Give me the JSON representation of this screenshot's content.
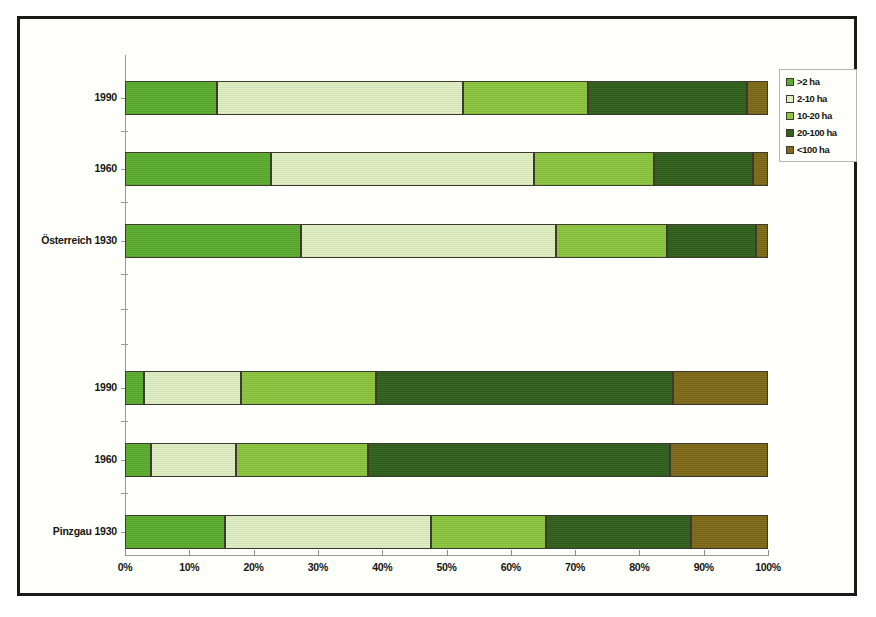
{
  "chart_data": {
    "type": "bar",
    "orientation": "horizontal",
    "stacked": true,
    "stack_unit": "percent",
    "title": "",
    "xlabel": "",
    "ylabel": "",
    "xlim": [
      0,
      100
    ],
    "grid": false,
    "legend_position": "top-right",
    "xticks": [
      "0%",
      "10%",
      "20%",
      "30%",
      "40%",
      "50%",
      "60%",
      "70%",
      "80%",
      "90%",
      "100%"
    ],
    "xtick_values": [
      0,
      10,
      20,
      30,
      40,
      50,
      60,
      70,
      80,
      90,
      100
    ],
    "categories": [
      "1990",
      "1960",
      "Österreich 1930",
      "1990",
      "1960",
      "Pinzgau 1930"
    ],
    "legend": [
      {
        "label": ">2 ha",
        "color": "#5cad2f"
      },
      {
        "label": "2-10 ha",
        "color": "#dff0c2"
      },
      {
        "label": "10-20 ha",
        "color": "#8cc63f"
      },
      {
        "label": "20-100 ha",
        "color": "#31601c"
      },
      {
        "label": "<100 ha",
        "color": "#7e6a18"
      }
    ],
    "series": [
      {
        "name": ">2 ha",
        "color": "#5cad2f",
        "values": [
          14.3,
          22.7,
          27.4,
          3.0,
          4.0,
          15.5
        ]
      },
      {
        "name": "2-10 ha",
        "color": "#dff0c2",
        "values": [
          38.2,
          40.9,
          39.6,
          15.0,
          13.3,
          32.1
        ]
      },
      {
        "name": "10-20 ha",
        "color": "#8cc63f",
        "values": [
          19.5,
          18.7,
          17.3,
          21.0,
          20.5,
          17.9
        ]
      },
      {
        "name": "20-100 ha",
        "color": "#31601c",
        "values": [
          24.8,
          15.4,
          13.8,
          46.3,
          47.0,
          22.5
        ]
      },
      {
        "name": "<100 ha",
        "color": "#7e6a18",
        "values": [
          3.2,
          2.3,
          1.9,
          14.7,
          15.2,
          12.0
        ]
      }
    ],
    "rows": [
      {
        "label": "1990",
        "group": "Österreich",
        "segments": [
          {
            "name": ">2 ha",
            "start": 0.0,
            "end": 14.3,
            "value": 14.3,
            "color": "#5cad2f"
          },
          {
            "name": "2-10 ha",
            "start": 14.3,
            "end": 52.5,
            "value": 38.2,
            "color": "#dff0c2"
          },
          {
            "name": "10-20 ha",
            "start": 52.5,
            "end": 72.0,
            "value": 19.5,
            "color": "#8cc63f"
          },
          {
            "name": "20-100 ha",
            "start": 72.0,
            "end": 96.8,
            "value": 24.8,
            "color": "#31601c"
          },
          {
            "name": "<100 ha",
            "start": 96.8,
            "end": 100.0,
            "value": 3.2,
            "color": "#7e6a18"
          }
        ]
      },
      {
        "label": "1960",
        "group": "Österreich",
        "segments": [
          {
            "name": ">2 ha",
            "start": 0.0,
            "end": 22.7,
            "value": 22.7,
            "color": "#5cad2f"
          },
          {
            "name": "2-10 ha",
            "start": 22.7,
            "end": 63.6,
            "value": 40.9,
            "color": "#dff0c2"
          },
          {
            "name": "10-20 ha",
            "start": 63.6,
            "end": 82.3,
            "value": 18.7,
            "color": "#8cc63f"
          },
          {
            "name": "20-100 ha",
            "start": 82.3,
            "end": 97.7,
            "value": 15.4,
            "color": "#31601c"
          },
          {
            "name": "<100 ha",
            "start": 97.7,
            "end": 100.0,
            "value": 2.3,
            "color": "#7e6a18"
          }
        ]
      },
      {
        "label": "Österreich 1930",
        "group": "Österreich",
        "segments": [
          {
            "name": ">2 ha",
            "start": 0.0,
            "end": 27.4,
            "value": 27.4,
            "color": "#5cad2f"
          },
          {
            "name": "2-10 ha",
            "start": 27.4,
            "end": 67.0,
            "value": 39.6,
            "color": "#dff0c2"
          },
          {
            "name": "10-20 ha",
            "start": 67.0,
            "end": 84.3,
            "value": 17.3,
            "color": "#8cc63f"
          },
          {
            "name": "20-100 ha",
            "start": 84.3,
            "end": 98.1,
            "value": 13.8,
            "color": "#31601c"
          },
          {
            "name": "<100 ha",
            "start": 98.1,
            "end": 100.0,
            "value": 1.9,
            "color": "#7e6a18"
          }
        ]
      },
      {
        "label": "1990",
        "group": "Pinzgau",
        "segments": [
          {
            "name": ">2 ha",
            "start": 0.0,
            "end": 3.0,
            "value": 3.0,
            "color": "#5cad2f"
          },
          {
            "name": "2-10 ha",
            "start": 3.0,
            "end": 18.0,
            "value": 15.0,
            "color": "#dff0c2"
          },
          {
            "name": "10-20 ha",
            "start": 18.0,
            "end": 39.0,
            "value": 21.0,
            "color": "#8cc63f"
          },
          {
            "name": "20-100 ha",
            "start": 39.0,
            "end": 85.3,
            "value": 46.3,
            "color": "#31601c"
          },
          {
            "name": "<100 ha",
            "start": 85.3,
            "end": 100.0,
            "value": 14.7,
            "color": "#7e6a18"
          }
        ]
      },
      {
        "label": "1960",
        "group": "Pinzgau",
        "segments": [
          {
            "name": ">2 ha",
            "start": 0.0,
            "end": 4.0,
            "value": 4.0,
            "color": "#5cad2f"
          },
          {
            "name": "2-10 ha",
            "start": 4.0,
            "end": 17.3,
            "value": 13.3,
            "color": "#dff0c2"
          },
          {
            "name": "10-20 ha",
            "start": 17.3,
            "end": 37.8,
            "value": 20.5,
            "color": "#8cc63f"
          },
          {
            "name": "20-100 ha",
            "start": 37.8,
            "end": 84.8,
            "value": 47.0,
            "color": "#31601c"
          },
          {
            "name": "<100 ha",
            "start": 84.8,
            "end": 100.0,
            "value": 15.2,
            "color": "#7e6a18"
          }
        ]
      },
      {
        "label": "Pinzgau 1930",
        "group": "Pinzgau",
        "segments": [
          {
            "name": ">2 ha",
            "start": 0.0,
            "end": 15.5,
            "value": 15.5,
            "color": "#5cad2f"
          },
          {
            "name": "2-10 ha",
            "start": 15.5,
            "end": 47.6,
            "value": 32.1,
            "color": "#dff0c2"
          },
          {
            "name": "10-20 ha",
            "start": 47.6,
            "end": 65.5,
            "value": 17.9,
            "color": "#8cc63f"
          },
          {
            "name": "20-100 ha",
            "start": 65.5,
            "end": 88.0,
            "value": 22.5,
            "color": "#31601c"
          },
          {
            "name": "<100 ha",
            "start": 88.0,
            "end": 100.0,
            "value": 12.0,
            "color": "#7e6a18"
          }
        ]
      }
    ],
    "row_tops_px": [
      62,
      133,
      205,
      352,
      424,
      496
    ],
    "row_height_px": 34
  }
}
